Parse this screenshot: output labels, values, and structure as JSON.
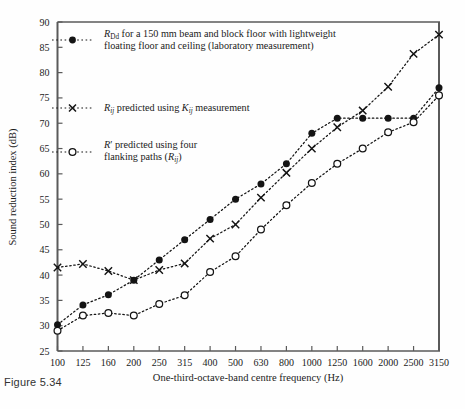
{
  "figure": {
    "caption": "Figure 5.34"
  },
  "axes": {
    "x_label": "One-third-octave-band centre frequency (Hz)",
    "y_label": "Sound reduction index (dB)",
    "y_ticks": [
      "25",
      "30",
      "35",
      "40",
      "45",
      "50",
      "55",
      "60",
      "65",
      "70",
      "75",
      "80",
      "85",
      "90"
    ],
    "x_ticks": [
      "100",
      "125",
      "160",
      "200",
      "250",
      "315",
      "400",
      "500",
      "630",
      "800",
      "1000",
      "1250",
      "1600",
      "2000",
      "2500",
      "3150"
    ]
  },
  "legend": {
    "entries": [
      {
        "marker": "filled-circle-icon",
        "sym": "R",
        "sub": "Dd",
        "line1": " for a 150 mm beam and block floor with lightweight",
        "line2": "floating floor and ceiling (laboratory measurement)"
      },
      {
        "marker": "cross-icon",
        "sym": "R",
        "sub": "ij",
        "line1": " predicted using ",
        "sym2": "K",
        "sub2": "ij",
        "line2": " measurement"
      },
      {
        "marker": "open-circle-icon",
        "sym": "R′",
        "line1": " predicted using four",
        "line2": "flanking paths (",
        "sym2": "R",
        "sub2": "ij",
        "line3": ")"
      }
    ]
  },
  "chart_data": {
    "type": "line",
    "title": "",
    "xlabel": "One-third-octave-band centre frequency (Hz)",
    "ylabel": "Sound reduction index (dB)",
    "ylim": [
      25,
      90
    ],
    "ytick_step": 5,
    "grid": false,
    "legend_position": "upper-left-inside",
    "categories": [
      "100",
      "125",
      "160",
      "200",
      "250",
      "315",
      "400",
      "500",
      "630",
      "800",
      "1000",
      "1250",
      "1600",
      "2000",
      "2500",
      "3150"
    ],
    "series": [
      {
        "name": "R_Dd for a 150 mm beam and block floor with lightweight floating floor and ceiling (laboratory measurement)",
        "marker": "filled-circle",
        "linestyle": "dotted",
        "color": "#141414",
        "values": [
          30.2,
          34.1,
          36.1,
          39.0,
          43.0,
          47.0,
          51.0,
          55.0,
          58.0,
          62.0,
          68.0,
          71.0,
          71.0,
          71.0,
          71.0,
          77.0
        ]
      },
      {
        "name": "R_ij predicted using K_ij measurement",
        "marker": "cross",
        "linestyle": "dotted",
        "color": "#141414",
        "values": [
          41.5,
          42.2,
          40.8,
          39.0,
          41.0,
          42.3,
          47.2,
          50.0,
          55.3,
          60.2,
          65.0,
          69.2,
          72.5,
          77.2,
          83.7,
          87.5
        ]
      },
      {
        "name": "R' predicted using four flanking paths (R_ij)",
        "marker": "open-circle",
        "linestyle": "dotted",
        "color": "#141414",
        "values": [
          29.0,
          32.0,
          32.5,
          32.0,
          34.3,
          36.0,
          40.6,
          43.7,
          49.0,
          53.8,
          58.2,
          62.0,
          65.0,
          68.2,
          70.2,
          75.5
        ]
      }
    ]
  }
}
